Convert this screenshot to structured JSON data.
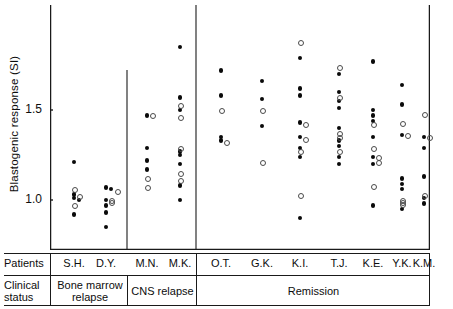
{
  "figure": {
    "y_axis_title": "Blastogenic response (SI)",
    "y_ticks": [
      {
        "label": "1.5",
        "value": 1.5
      },
      {
        "label": "1.0",
        "value": 1.0
      }
    ],
    "row_labels": {
      "patients": "Patients",
      "clinical_status_line1": "Clinical",
      "clinical_status_line2": "status"
    },
    "group_labels": [
      {
        "text": "Bone marrow relapse",
        "line1": "Bone marrow",
        "line2": "relapse"
      },
      {
        "text": "CNS relapse",
        "line1": "CNS relapse",
        "line2": ""
      },
      {
        "text": "Remission",
        "line1": "Remission",
        "line2": ""
      }
    ]
  },
  "chart_data": {
    "type": "scatter",
    "title": "",
    "xlabel": "Patients",
    "ylabel": "Blastogenic response (SI)",
    "ylim": [
      0.72,
      1.86
    ],
    "grid": false,
    "legend": [
      {
        "name": "filled circle",
        "marker": "filled"
      },
      {
        "name": "open circle",
        "marker": "open"
      }
    ],
    "categories": [
      "S.H.",
      "D.Y.",
      "M.N.",
      "M.K.",
      "O.T.",
      "G.K.",
      "K.I.",
      "T.J.",
      "K.E.",
      "Y.K.",
      "K.M."
    ],
    "groups": [
      {
        "label": "Bone marrow relapse",
        "categories": [
          "S.H.",
          "D.Y."
        ]
      },
      {
        "label": "CNS relapse",
        "categories": [
          "M.N.",
          "M.K."
        ]
      },
      {
        "label": "Remission",
        "categories": [
          "O.T.",
          "G.K.",
          "K.I.",
          "T.J.",
          "K.E.",
          "Y.K.",
          "K.M."
        ]
      }
    ],
    "columns": [
      {
        "patient": "S.H.",
        "filled": [
          1.21,
          1.03,
          1.01,
          1.0,
          0.92
        ],
        "open": [
          1.06,
          1.02,
          0.97
        ]
      },
      {
        "patient": "D.Y.",
        "filled": [
          1.07,
          1.06,
          1.0,
          0.97,
          0.93,
          0.85
        ],
        "open": [
          1.05,
          1.0,
          0.99
        ]
      },
      {
        "patient": "M.N.",
        "filled": [
          1.47,
          1.29,
          1.22,
          1.17
        ],
        "open": [
          1.47,
          1.12,
          1.07
        ]
      },
      {
        "patient": "M.K.",
        "filled": [
          1.85,
          1.57,
          1.5,
          1.27,
          1.25,
          1.2,
          1.08,
          1.0
        ],
        "open": [
          1.53,
          1.46,
          1.29,
          1.15,
          1.11
        ]
      },
      {
        "patient": "O.T.",
        "filled": [
          1.72,
          1.58,
          1.35,
          1.33
        ],
        "open": [
          1.5,
          1.32
        ]
      },
      {
        "patient": "G.K.",
        "filled": [
          1.66,
          1.56,
          1.41
        ],
        "open": [
          1.5,
          1.21
        ]
      },
      {
        "patient": "K.I.",
        "filled": [
          1.79,
          1.62,
          1.58,
          1.43,
          1.35,
          1.29,
          1.24,
          0.9
        ],
        "open": [
          1.88,
          1.42,
          1.34,
          1.27,
          1.03
        ]
      },
      {
        "patient": "T.J.",
        "filled": [
          1.7,
          1.6,
          1.55,
          1.51,
          1.4,
          1.33,
          1.3,
          1.24,
          1.2
        ],
        "open": [
          1.74,
          1.57,
          1.37,
          1.35,
          1.27
        ]
      },
      {
        "patient": "K.E.",
        "filled": [
          1.77,
          1.5,
          1.47,
          1.44,
          1.35,
          1.24,
          1.2,
          0.97
        ],
        "open": [
          1.42,
          1.29,
          1.24,
          1.21,
          1.08
        ]
      },
      {
        "patient": "Y.K.",
        "filled": [
          1.64,
          1.53,
          1.36,
          1.12,
          1.09,
          1.06,
          0.95
        ],
        "open": [
          1.43,
          1.36,
          1.0,
          0.99,
          0.98
        ]
      },
      {
        "patient": "K.M.",
        "filled": [
          1.35,
          1.29,
          1.13,
          1.01,
          0.98
        ],
        "open": [
          1.48,
          1.35,
          1.03
        ]
      }
    ]
  }
}
